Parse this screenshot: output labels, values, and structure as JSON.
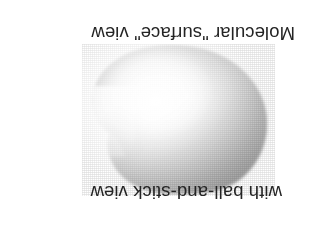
{
  "figure": {
    "background_color": "#ffffff",
    "orientation_note": "scan-rotated-180",
    "captions": {
      "top_line": "Molecular \"surface\" view",
      "bottom_line": "with ball-and-stick view"
    },
    "text_color": "#242424",
    "graphic": {
      "name": "molecular-surface-blob",
      "kind": "grayscale shaded molecular surface rendering",
      "highlight_color": "#ffffff",
      "midtone_color": "#d0d0d0",
      "shadow_color": "#8f8f8f",
      "edge_color": "#7a7a7a"
    }
  }
}
